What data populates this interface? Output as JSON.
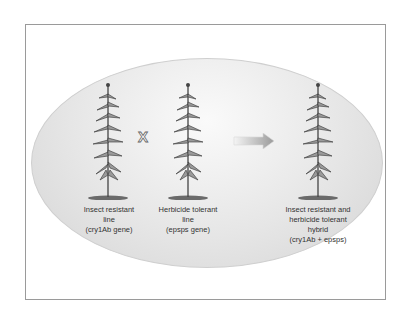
{
  "diagram": {
    "cross_symbol": "X",
    "plants": [
      {
        "label_lines": [
          "Insect resistant",
          "line",
          "(cry1Ab gene)"
        ]
      },
      {
        "label_lines": [
          "Herbicide tolerant",
          "line",
          "(epsps gene)"
        ]
      },
      {
        "label_lines": [
          "Insect resistant and",
          "herbicide tolerant",
          "hybrid",
          "(cry1Ab + epsps)"
        ]
      }
    ],
    "arrow": "right-arrow"
  }
}
